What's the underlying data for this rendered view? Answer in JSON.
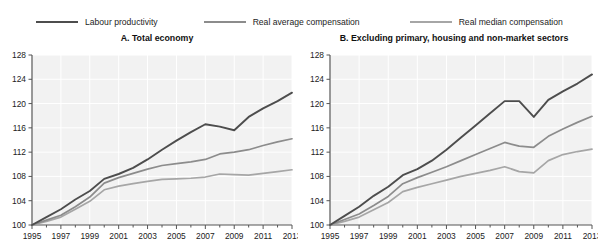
{
  "legend": {
    "items": [
      {
        "label": "Labour productivity",
        "color": "#4d4d4d",
        "key": "labour_productivity"
      },
      {
        "label": "Real average compensation",
        "color": "#8c8c8c",
        "key": "real_average_compensation"
      },
      {
        "label": "Real median compensation",
        "color": "#a6a6a6",
        "key": "real_median_compensation"
      }
    ]
  },
  "panels": [
    {
      "id": "A",
      "title": "A. Total economy"
    },
    {
      "id": "B",
      "title": "B. Excluding primary, housing and non-market sectors"
    }
  ],
  "axis": {
    "y_ticks": [
      100,
      104,
      108,
      112,
      116,
      120,
      124,
      128
    ],
    "x_ticks": [
      1995,
      1997,
      1999,
      2001,
      2003,
      2005,
      2007,
      2009,
      2011,
      2013
    ]
  },
  "chart_data": [
    {
      "type": "line",
      "title": "A. Total economy",
      "xlabel": "",
      "ylabel": "",
      "xlim": [
        1995,
        2013
      ],
      "ylim": [
        100,
        128
      ],
      "grid": true,
      "legend_position": "top",
      "x": [
        1995,
        1996,
        1997,
        1998,
        1999,
        2000,
        2001,
        2002,
        2003,
        2004,
        2005,
        2006,
        2007,
        2008,
        2009,
        2010,
        2011,
        2012,
        2013
      ],
      "series": [
        {
          "name": "Labour productivity",
          "color": "#4d4d4d",
          "values": [
            100.0,
            101.3,
            102.6,
            104.2,
            105.6,
            107.6,
            108.4,
            109.4,
            110.8,
            112.4,
            113.9,
            115.3,
            116.6,
            116.2,
            115.6,
            117.8,
            119.2,
            120.4,
            121.8
          ]
        },
        {
          "name": "Real average compensation",
          "color": "#8c8c8c",
          "values": [
            100.0,
            100.8,
            101.6,
            103.0,
            104.6,
            106.9,
            107.8,
            108.5,
            109.2,
            109.8,
            110.1,
            110.4,
            110.8,
            111.7,
            112.0,
            112.4,
            113.1,
            113.7,
            114.2
          ]
        },
        {
          "name": "Real median compensation",
          "color": "#a6a6a6",
          "values": [
            100.0,
            100.6,
            101.3,
            102.6,
            103.9,
            105.8,
            106.4,
            106.8,
            107.2,
            107.5,
            107.6,
            107.7,
            107.9,
            108.4,
            108.3,
            108.2,
            108.5,
            108.8,
            109.1
          ]
        }
      ]
    },
    {
      "type": "line",
      "title": "B. Excluding primary, housing and non-market sectors",
      "xlabel": "",
      "ylabel": "",
      "xlim": [
        1995,
        2013
      ],
      "ylim": [
        100,
        128
      ],
      "grid": true,
      "legend_position": "top",
      "x": [
        1995,
        1996,
        1997,
        1998,
        1999,
        2000,
        2001,
        2002,
        2003,
        2004,
        2005,
        2006,
        2007,
        2008,
        2009,
        2010,
        2011,
        2012,
        2013
      ],
      "series": [
        {
          "name": "Labour productivity",
          "color": "#4d4d4d",
          "values": [
            100.0,
            101.5,
            103.0,
            104.8,
            106.3,
            108.2,
            109.2,
            110.6,
            112.4,
            114.4,
            116.4,
            118.4,
            120.4,
            120.4,
            117.8,
            120.6,
            122.0,
            123.3,
            124.8
          ]
        },
        {
          "name": "Real average compensation",
          "color": "#8c8c8c",
          "values": [
            100.0,
            100.9,
            101.8,
            103.2,
            104.7,
            106.8,
            107.8,
            108.7,
            109.6,
            110.6,
            111.6,
            112.6,
            113.6,
            113.0,
            112.8,
            114.6,
            115.8,
            116.9,
            117.9
          ]
        },
        {
          "name": "Real median compensation",
          "color": "#a6a6a6",
          "values": [
            100.0,
            100.6,
            101.3,
            102.5,
            103.7,
            105.5,
            106.2,
            106.8,
            107.4,
            108.0,
            108.5,
            109.0,
            109.6,
            108.8,
            108.6,
            110.6,
            111.6,
            112.1,
            112.5
          ]
        }
      ]
    }
  ]
}
